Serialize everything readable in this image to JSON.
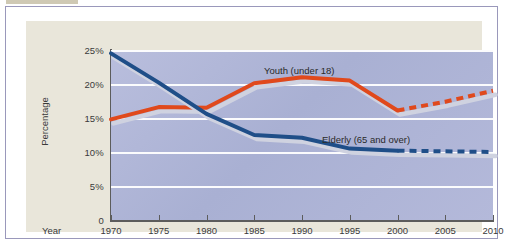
{
  "figure": {
    "panel_bg": "#e9e6da",
    "plot_bg": "#b1b7d8",
    "frame_color": "#9a98bb"
  },
  "axis": {
    "y_title": "Percentage",
    "x_title": "Year",
    "y_ticks": [
      "25%",
      "20%",
      "15%",
      "10%",
      "5%",
      "0"
    ],
    "x_ticks": [
      "1970",
      "1975",
      "1980",
      "1985",
      "1990",
      "1995",
      "2000",
      "2005",
      "2010"
    ]
  },
  "legend": {
    "youth": "Youth (under 18)",
    "elderly": "Elderly (65 and over)"
  },
  "chart_data": {
    "type": "line",
    "title": "",
    "xlabel": "Year",
    "ylabel": "Percentage",
    "xlim": [
      1970,
      2010
    ],
    "ylim": [
      0,
      25
    ],
    "grid": true,
    "legend_position": "inline-annotations",
    "x": [
      1970,
      1975,
      1980,
      1985,
      1990,
      1995,
      2000,
      2005,
      2010
    ],
    "series": [
      {
        "name": "Youth (under 18)",
        "color": "#e0491c",
        "values": [
          14.8,
          16.6,
          16.5,
          20.1,
          21.0,
          20.5,
          16.1,
          17.4,
          19.0
        ],
        "solid_through": 2000,
        "projected_from": 2000,
        "style": "solid-then-dashed"
      },
      {
        "name": "Elderly (65 and over)",
        "color": "#1f4e88",
        "values": [
          24.5,
          20.2,
          15.6,
          12.5,
          12.1,
          10.5,
          10.2,
          10.1,
          10.0
        ],
        "solid_through": 2000,
        "projected_from": 2000,
        "style": "solid-then-dashed"
      }
    ],
    "annotations": [
      {
        "text": "Youth (under 18)",
        "x": 1988,
        "y": 22.3
      },
      {
        "text": "Elderly (65 and over)",
        "x": 1994,
        "y": 12.6
      }
    ]
  }
}
